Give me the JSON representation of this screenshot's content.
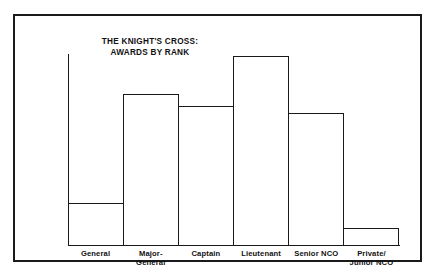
{
  "figure": {
    "title_line1": "THE KNIGHT'S CROSS:",
    "title_line2": "AWARDS BY RANK",
    "frame_color": "#1a1a1a",
    "bar_fill": "#ffffff",
    "bar_outline": "#1a1a1a",
    "background": "#ffffff"
  },
  "chart_data": {
    "type": "bar",
    "title": "THE KNIGHT'S CROSS: AWARDS BY RANK",
    "xlabel": "",
    "ylabel": "",
    "grid": false,
    "legend": "none",
    "axis_tick_labels": [],
    "ylim": [
      0,
      100
    ],
    "categories": [
      "General",
      "Major-General",
      "Captain",
      "Lieutenant",
      "Senior NCO",
      "Private/Junior NCO"
    ],
    "category_lines": [
      [
        "General",
        ""
      ],
      [
        "Major-",
        "General"
      ],
      [
        "Captain",
        ""
      ],
      [
        "Lieutenant",
        ""
      ],
      [
        "Senior NCO",
        ""
      ],
      [
        "Private/",
        "Junior NCO"
      ]
    ],
    "values": [
      22,
      79,
      73,
      99,
      69,
      9
    ],
    "bars": [
      {
        "label": "General",
        "value": 22,
        "height_pct": 22
      },
      {
        "label": "Major-General",
        "value": 79,
        "height_pct": 79
      },
      {
        "label": "Captain",
        "value": 73,
        "height_pct": 73
      },
      {
        "label": "Lieutenant",
        "value": 99,
        "height_pct": 99
      },
      {
        "label": "Senior NCO",
        "value": 69,
        "height_pct": 69
      },
      {
        "label": "Private/Junior NCO",
        "value": 9,
        "height_pct": 9
      }
    ]
  }
}
